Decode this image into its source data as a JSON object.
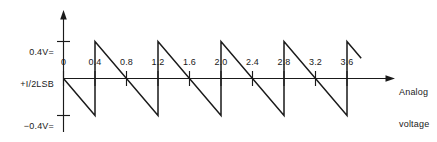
{
  "chart_data": {
    "type": "line",
    "title": "",
    "subtitle": "",
    "xlabel": "Analog voltage",
    "ylabel": "",
    "xlim": [
      0,
      4.0
    ],
    "ylim": [
      -0.4,
      0.4
    ],
    "grid": false,
    "legend": null,
    "x_ticks": [
      "0",
      "0.4",
      "0.8",
      "1.2",
      "1.6",
      "2.0",
      "2.4",
      "2.8",
      "3.2",
      "3.6"
    ],
    "x_tick_values": [
      0,
      0.4,
      0.8,
      1.2,
      1.6,
      2.0,
      2.4,
      2.8,
      3.2,
      3.6
    ],
    "y_ticks": [
      "0.4V=\n+I/2LSB",
      "-0.4V=\n-I/2LSB"
    ],
    "y_tick_values": [
      0.4,
      -0.4
    ],
    "series": [
      {
        "name": "quantization error",
        "comment": "sawtooth: ramps down from +1/2LSB to -1/2LSB over each 0.8V period, vertical jump up at 0.4,1.2,2.0,2.8,3.6",
        "points": [
          [
            0.0,
            0.0
          ],
          [
            0.4,
            -0.4
          ],
          [
            0.4,
            0.4
          ],
          [
            1.2,
            -0.4
          ],
          [
            1.2,
            0.4
          ],
          [
            2.0,
            -0.4
          ],
          [
            2.0,
            0.4
          ],
          [
            2.8,
            -0.4
          ],
          [
            2.8,
            0.4
          ],
          [
            3.6,
            -0.4
          ],
          [
            3.6,
            0.4
          ],
          [
            3.78,
            0.22
          ]
        ]
      }
    ]
  },
  "labels": {
    "y_upper_line1": "0.4V=",
    "y_upper_line2": "+I/2LSB",
    "y_lower_line1": "−0.4V=",
    "y_lower_line2": "−I/2LSB",
    "x_axis_line1": "Analog",
    "x_axis_line2": "voltage",
    "origin": "0",
    "tick_0_4": "0.4",
    "tick_0_8": "0.8",
    "tick_1_2": "1.2",
    "tick_1_6": "1.6",
    "tick_2_0": "2.0",
    "tick_2_4": "2.4",
    "tick_2_8": "2.8",
    "tick_3_2": "3.2",
    "tick_3_6": "3.6"
  },
  "colors": {
    "ink": "#1a1a1a",
    "background": "#ffffff"
  }
}
